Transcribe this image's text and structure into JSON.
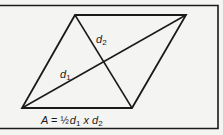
{
  "diagram": {
    "colors": {
      "background": "#f4f4f2",
      "stroke": "#1a1a1a"
    },
    "shape": {
      "type": "rhombus",
      "vertices": {
        "top_left": [
          75,
          15
        ],
        "top_right": [
          186,
          15
        ],
        "bottom_right": [
          132,
          108
        ],
        "bottom_left": [
          22,
          108
        ]
      }
    },
    "diagonals": [
      {
        "name": "d1",
        "from": "bottom_left",
        "to": "top_right"
      },
      {
        "name": "d2",
        "from": "top_left",
        "to": "bottom_right"
      }
    ],
    "labels": {
      "d1": {
        "base": "d",
        "sub": "1"
      },
      "d2": {
        "base": "d",
        "sub": "2"
      }
    },
    "formula": {
      "A": "A",
      "eq": "=",
      "half": "½",
      "d": "d",
      "sub1": "1",
      "times": "x",
      "sub2": "2"
    }
  }
}
